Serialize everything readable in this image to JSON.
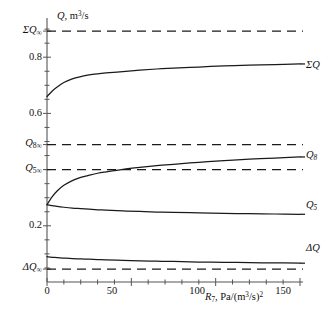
{
  "chart_data": {
    "type": "line",
    "title": "",
    "xlabel": "R7, Pa/(m3/s)2",
    "ylabel": "Q, m3/s",
    "xlim": [
      0,
      150
    ],
    "ylim": [
      0.0,
      0.93
    ],
    "grid": false,
    "legend": "inline-right-of-curve",
    "x_ticks": [
      "0",
      "50",
      "100",
      "150"
    ],
    "x_tick_values": [
      0,
      50,
      100,
      150
    ],
    "y_ticks": [
      "0.2",
      "0.6",
      "0.8"
    ],
    "y_tick_values": [
      0.2,
      0.6,
      0.8
    ],
    "y_named_ticks": [
      {
        "label": "SigmaQ_inf",
        "value": 0.893
      },
      {
        "label": "Q8_inf",
        "value": 0.489
      },
      {
        "label": "Q5_inf",
        "value": 0.4
      },
      {
        "label": "DeltaQ_inf",
        "value": 0.046
      }
    ],
    "series": [
      {
        "name": "SigmaQ",
        "style": "solid",
        "label": "ΣQ",
        "x": [
          0,
          3,
          6,
          10,
          15,
          20,
          25,
          30,
          35,
          45,
          55,
          65,
          75,
          90,
          105,
          120,
          135,
          150
        ],
        "values": [
          0.66,
          0.679,
          0.694,
          0.71,
          0.723,
          0.731,
          0.737,
          0.741,
          0.744,
          0.749,
          0.754,
          0.758,
          0.761,
          0.765,
          0.769,
          0.772,
          0.774,
          0.776
        ]
      },
      {
        "name": "Q8",
        "style": "solid",
        "label": "Q₈",
        "x": [
          0,
          3,
          6,
          10,
          15,
          20,
          25,
          30,
          35,
          45,
          55,
          65,
          75,
          90,
          105,
          120,
          135,
          150
        ],
        "values": [
          0.275,
          0.303,
          0.324,
          0.344,
          0.361,
          0.372,
          0.38,
          0.387,
          0.392,
          0.401,
          0.408,
          0.414,
          0.419,
          0.426,
          0.432,
          0.437,
          0.441,
          0.445
        ]
      },
      {
        "name": "Q5",
        "style": "solid",
        "label": "Q₅",
        "x": [
          0,
          3,
          6,
          10,
          15,
          20,
          25,
          30,
          35,
          45,
          55,
          65,
          75,
          90,
          105,
          120,
          135,
          150
        ],
        "values": [
          0.275,
          0.272,
          0.269,
          0.266,
          0.263,
          0.261,
          0.259,
          0.257,
          0.256,
          0.253,
          0.251,
          0.249,
          0.248,
          0.246,
          0.244,
          0.243,
          0.242,
          0.241
        ]
      },
      {
        "name": "DeltaQ",
        "style": "solid",
        "label": "ΔQ",
        "x": [
          0,
          3,
          6,
          10,
          15,
          20,
          25,
          30,
          35,
          45,
          55,
          65,
          75,
          90,
          105,
          120,
          135,
          150
        ],
        "values": [
          0.09,
          0.088,
          0.087,
          0.085,
          0.083,
          0.082,
          0.081,
          0.08,
          0.079,
          0.077,
          0.075,
          0.074,
          0.073,
          0.071,
          0.07,
          0.069,
          0.068,
          0.067
        ]
      }
    ],
    "asymptotes": [
      {
        "name": "SigmaQ_inf",
        "style": "dashed",
        "value": 0.893
      },
      {
        "name": "Q8_inf",
        "style": "dashed",
        "value": 0.489
      },
      {
        "name": "Q5_inf",
        "style": "dashed",
        "value": 0.4
      },
      {
        "name": "DeltaQ_inf",
        "style": "dashed",
        "value": 0.046
      }
    ]
  },
  "axes": {
    "y_axis_title_main": "Q",
    "y_axis_title_rest": ", m",
    "y_axis_title_sup": "3",
    "y_axis_title_tail": "/s",
    "x_axis_title_main": "R",
    "x_axis_title_sub": "7",
    "x_axis_title_rest": ", Pa/(m",
    "x_axis_title_sup": "3",
    "x_axis_title_tail": "/s)",
    "x_axis_title_sup2": "2"
  },
  "y_tick_labels": {
    "t08": "0.8",
    "t06": "0.6",
    "t02": "0.2"
  },
  "x_tick_labels": {
    "t0": "0",
    "t50": "50",
    "t100": "100",
    "t150": "150"
  },
  "asymptote_labels": {
    "sigma_q_inf_sym": "ΣQ",
    "sigma_q_inf_sub": "∞",
    "q8_inf_sym": "Q",
    "q8_inf_sub": "8∞",
    "q5_inf_sym": "Q",
    "q5_inf_sub": "5∞",
    "dq_inf_sym": "ΔQ",
    "dq_inf_sub": "∞"
  },
  "curve_labels": {
    "sigma_q": "ΣQ",
    "q8_sym": "Q",
    "q8_sub": "8",
    "q5_sym": "Q",
    "q5_sub": "5",
    "delta_q": "ΔQ"
  },
  "colors": {
    "line": "#1a1a1a",
    "axis": "#555555",
    "background": "#ffffff"
  }
}
